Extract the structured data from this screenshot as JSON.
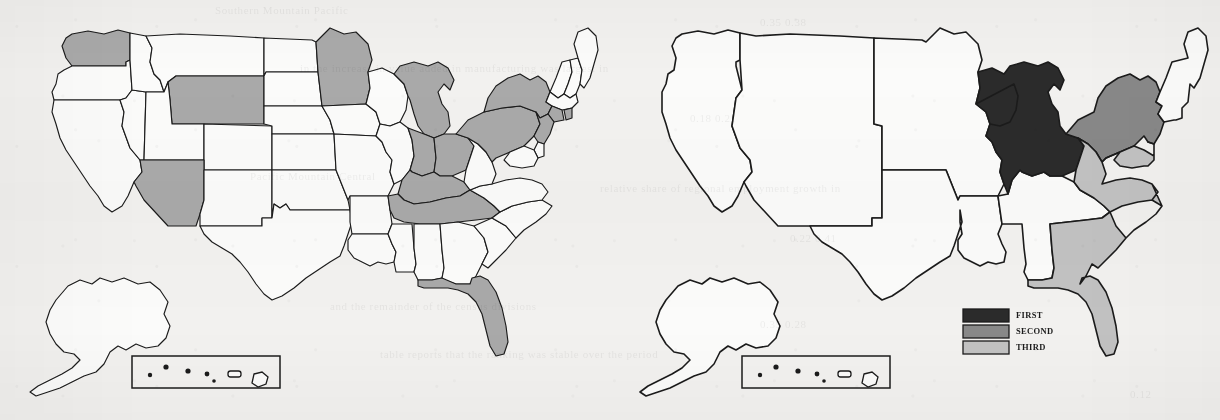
{
  "figure": {
    "background_color": "#f2f1ef",
    "ink_color": "#1b1b1b",
    "panel_count": 2
  },
  "ghost_text": {
    "rows": [
      {
        "text": "Southern         Mountain         Pacific",
        "x": 215,
        "y": 4,
        "size": 11
      },
      {
        "text": "0.35                                      0.38",
        "x": 760,
        "y": 16,
        "size": 11
      },
      {
        "text": "in the increase in value added in manufacturing was largest in",
        "x": 300,
        "y": 62,
        "size": 11
      },
      {
        "text": "0.18                                      0.21",
        "x": 690,
        "y": 112,
        "size": 11
      },
      {
        "text": "Pacific         Mountain         Central",
        "x": 250,
        "y": 170,
        "size": 11
      },
      {
        "text": "relative share of regional employment growth in",
        "x": 600,
        "y": 182,
        "size": 11
      },
      {
        "text": "0.22                                      0.41",
        "x": 790,
        "y": 232,
        "size": 11
      },
      {
        "text": "and the remainder of the census divisions",
        "x": 330,
        "y": 300,
        "size": 11
      },
      {
        "text": "0.35                                      0.28",
        "x": 760,
        "y": 318,
        "size": 11
      },
      {
        "text": "table reports that the ranking was stable over the period",
        "x": 380,
        "y": 348,
        "size": 11
      },
      {
        "text": "0.12",
        "x": 1130,
        "y": 388,
        "size": 11
      }
    ]
  },
  "legend": {
    "title": "",
    "position": "right-panel-lower-center",
    "entries": [
      {
        "label": "FIRST",
        "color": "#2b2b2b",
        "rank": 1
      },
      {
        "label": "SECOND",
        "color": "#888888",
        "rank": 2
      },
      {
        "label": "THIRD",
        "color": "#c2c2c2",
        "rank": 3
      }
    ]
  },
  "left_map": {
    "name": "state-level-shaded-map",
    "shading_color": "#a9a9a9",
    "shaded_states": [
      "Washington",
      "Wyoming",
      "Arizona",
      "Minnesota",
      "Michigan",
      "Indiana",
      "Ohio",
      "Kentucky",
      "Tennessee",
      "Pennsylvania",
      "New York",
      "New Jersey",
      "Connecticut",
      "Rhode Island",
      "Florida"
    ],
    "unshaded_states": [
      "Oregon",
      "California",
      "Nevada",
      "Idaho",
      "Montana",
      "Utah",
      "Colorado",
      "New Mexico",
      "North Dakota",
      "South Dakota",
      "Nebraska",
      "Kansas",
      "Oklahoma",
      "Texas",
      "Iowa",
      "Missouri",
      "Arkansas",
      "Louisiana",
      "Wisconsin",
      "Illinois",
      "Mississippi",
      "Alabama",
      "Georgia",
      "South Carolina",
      "North Carolina",
      "Virginia",
      "West Virginia",
      "Maryland",
      "Delaware",
      "Maine",
      "New Hampshire",
      "Vermont",
      "Massachusetts",
      "Alaska",
      "Hawaii"
    ],
    "insets": [
      "Alaska",
      "Hawaii"
    ]
  },
  "right_map": {
    "name": "census-division-ranked-map",
    "divisions": [
      {
        "name": "Pacific",
        "rank": null,
        "fill": "#fbfbfa"
      },
      {
        "name": "Mountain",
        "rank": null,
        "fill": "#fbfbfa"
      },
      {
        "name": "West North Central",
        "rank": null,
        "fill": "#fbfbfa"
      },
      {
        "name": "West South Central",
        "rank": null,
        "fill": "#fbfbfa"
      },
      {
        "name": "East South Central",
        "rank": null,
        "fill": "#fbfbfa"
      },
      {
        "name": "New England",
        "rank": null,
        "fill": "#fbfbfa"
      },
      {
        "name": "East North Central",
        "rank": 1,
        "fill": "#2b2b2b",
        "rank_label": "FIRST"
      },
      {
        "name": "Middle Atlantic",
        "rank": 2,
        "fill": "#888888",
        "rank_label": "SECOND"
      },
      {
        "name": "South Atlantic",
        "rank": 3,
        "fill": "#c2c2c2",
        "rank_label": "THIRD"
      }
    ],
    "insets": [
      "Alaska",
      "Hawaii"
    ]
  },
  "chart_data": {
    "type": "map",
    "title": "",
    "subtitle": "",
    "panels": [
      {
        "panel": "left",
        "description": "United States state outline map with selected states shaded in medium gray",
        "unit": "state",
        "categories": [
          "shaded",
          "unshaded"
        ],
        "shaded_count": 15,
        "values": [
          {
            "region": "Washington",
            "shade": "gray",
            "value": 1
          },
          {
            "region": "Wyoming",
            "shade": "gray",
            "value": 1
          },
          {
            "region": "Arizona",
            "shade": "gray",
            "value": 1
          },
          {
            "region": "Minnesota",
            "shade": "gray",
            "value": 1
          },
          {
            "region": "Michigan",
            "shade": "gray",
            "value": 1
          },
          {
            "region": "Indiana",
            "shade": "gray",
            "value": 1
          },
          {
            "region": "Ohio",
            "shade": "gray",
            "value": 1
          },
          {
            "region": "Kentucky",
            "shade": "gray",
            "value": 1
          },
          {
            "region": "Tennessee",
            "shade": "gray",
            "value": 1
          },
          {
            "region": "Pennsylvania",
            "shade": "gray",
            "value": 1
          },
          {
            "region": "New York",
            "shade": "gray",
            "value": 1
          },
          {
            "region": "New Jersey",
            "shade": "gray",
            "value": 1
          },
          {
            "region": "Connecticut",
            "shade": "gray",
            "value": 1
          },
          {
            "region": "Rhode Island",
            "shade": "gray",
            "value": 1
          },
          {
            "region": "Florida",
            "shade": "gray",
            "value": 1
          }
        ]
      },
      {
        "panel": "right",
        "description": "United States census-division map with top three divisions shaded by rank",
        "unit": "census division",
        "categories": [
          "FIRST",
          "SECOND",
          "THIRD"
        ],
        "values": [
          {
            "region": "East North Central",
            "rank": 1,
            "label": "FIRST",
            "color": "#2b2b2b"
          },
          {
            "region": "Middle Atlantic",
            "rank": 2,
            "label": "SECOND",
            "color": "#888888"
          },
          {
            "region": "South Atlantic",
            "rank": 3,
            "label": "THIRD",
            "color": "#c2c2c2"
          }
        ],
        "legend_position": "lower-center"
      }
    ]
  }
}
